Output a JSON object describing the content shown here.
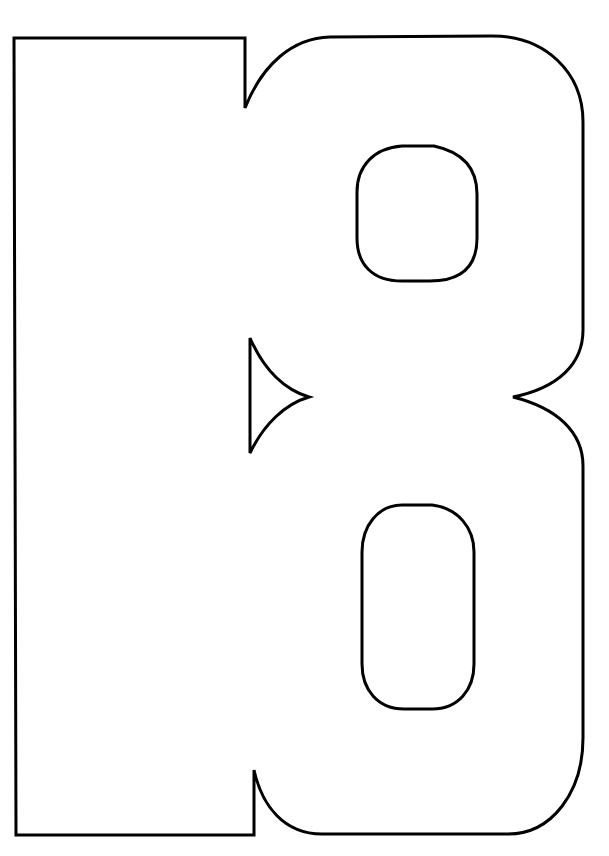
{
  "artwork": {
    "subject": "18",
    "style": "outline coloring page",
    "colors": {
      "background": "#ffffff",
      "stroke": "#000000",
      "fill": "#ffffff"
    },
    "stroke_width": 3
  }
}
